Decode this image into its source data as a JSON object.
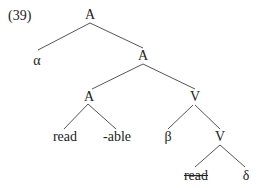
{
  "example_number": "(39)",
  "nodes": {
    "root": "A",
    "alpha": "α",
    "a2": "A",
    "a3": "A",
    "v3": "V",
    "read": "read",
    "able": "-able",
    "beta": "β",
    "v4": "V",
    "read_deleted": "read",
    "delta": "δ"
  }
}
